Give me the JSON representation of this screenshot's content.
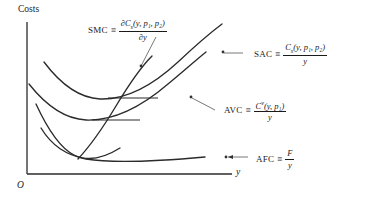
{
  "figure": {
    "type": "economics-cost-curves",
    "background_color": "#ffffff",
    "line_color": "#2b2b2b",
    "axes": {
      "y_axis_label": "Costs",
      "x_axis_label": "y",
      "origin_label": "O"
    },
    "curves": [
      {
        "id": "smc",
        "name": "SMC",
        "meaning": "short-run marginal cost",
        "shape": "upward-sloping-steep",
        "definition": {
          "numerator": "∂C",
          "numerator_sub": "s",
          "numerator_args": "(y, p₁, p₂)",
          "denominator": "∂y"
        }
      },
      {
        "id": "sac",
        "name": "SAC",
        "meaning": "short-run average cost",
        "shape": "u-shaped-upper",
        "definition": {
          "numerator": "C",
          "numerator_sub": "s",
          "numerator_args": "(y, p₁, p₂)",
          "denominator": "y"
        }
      },
      {
        "id": "avc",
        "name": "AVC",
        "meaning": "average variable cost",
        "shape": "u-shaped-middle",
        "definition": {
          "numerator": "C",
          "numerator_sup": "v",
          "numerator_args": "(y, p₁)",
          "denominator": "y"
        }
      },
      {
        "id": "afc",
        "name": "AFC",
        "meaning": "average fixed cost",
        "shape": "decreasing-hyperbola",
        "definition": {
          "numerator": "F",
          "denominator": "y"
        }
      }
    ],
    "labels": {
      "smc": {
        "name": "SMC",
        "equiv": "≡"
      },
      "sac": {
        "name": "SAC",
        "equiv": "≡"
      },
      "avc": {
        "name": "AVC",
        "equiv": "≡"
      },
      "afc": {
        "name": "AFC",
        "equiv": "≡"
      }
    },
    "annotations": {
      "tangent_note": "horizontal tangent segments mark the minima of SAC and AVC where SMC crosses"
    }
  }
}
